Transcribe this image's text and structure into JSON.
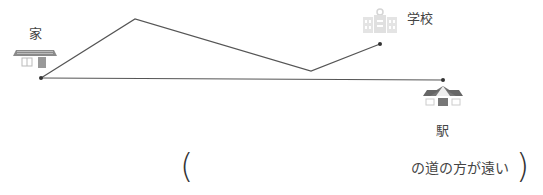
{
  "places": {
    "home": {
      "label": "家",
      "icon": "house-icon"
    },
    "school": {
      "label": "学校",
      "icon": "school-icon"
    },
    "station": {
      "label": "駅",
      "icon": "station-icon"
    }
  },
  "routes": [
    {
      "name": "home-to-school",
      "description": "zigzag path from home to school"
    },
    {
      "name": "home-to-station",
      "description": "straight path from home to station"
    }
  ],
  "answer": {
    "open_paren": "(",
    "blank": "",
    "suffix": "の道の方が遠い",
    "close_paren": ")"
  },
  "colors": {
    "line": "#555555",
    "icon_gray": "#8a8a8a",
    "school_light": "#d8d8d8"
  }
}
